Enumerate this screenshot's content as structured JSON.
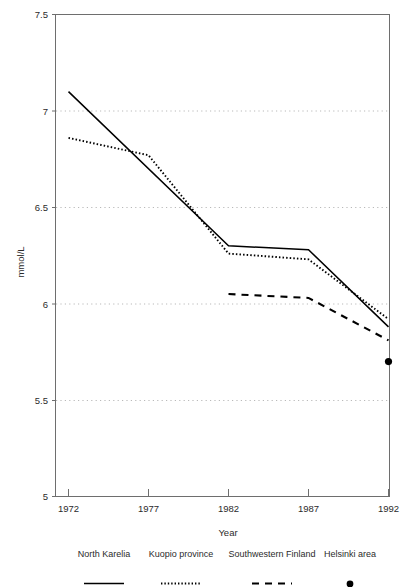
{
  "chart_data": {
    "type": "line",
    "title": "",
    "xlabel": "Year",
    "ylabel": "mmol/L",
    "x": [
      1972,
      1977,
      1982,
      1987,
      1992
    ],
    "xtick_labels": [
      "1972",
      "1977",
      "1982",
      "1987",
      "1992"
    ],
    "xlim": [
      1972,
      1992
    ],
    "ytick_labels": [
      "5",
      "5.5",
      "6",
      "6.5",
      "7",
      "7.5"
    ],
    "yticks": [
      5,
      5.5,
      6,
      6.5,
      7,
      7.5
    ],
    "ylim": [
      5,
      7.5
    ],
    "grid": "horizontal-dotted",
    "legend_position": "bottom",
    "series": [
      {
        "name": "North Karelia",
        "style": "solid",
        "color": "#000000",
        "x": [
          1972,
          1982,
          1987,
          1992
        ],
        "values": [
          7.1,
          6.3,
          6.28,
          5.88
        ]
      },
      {
        "name": "Kuopio province",
        "style": "dotted",
        "color": "#000000",
        "x": [
          1972,
          1977,
          1982,
          1987,
          1992
        ],
        "values": [
          6.86,
          6.77,
          6.26,
          6.23,
          5.92
        ]
      },
      {
        "name": "Southwestern Finland",
        "style": "dashed",
        "color": "#000000",
        "x": [
          1982,
          1987,
          1992
        ],
        "values": [
          6.05,
          6.03,
          5.81
        ]
      },
      {
        "name": "Helsinki area",
        "style": "marker-dot",
        "color": "#000000",
        "x": [
          1992
        ],
        "values": [
          5.7
        ]
      }
    ]
  },
  "axes": {
    "ylabel": "mmol/L",
    "xlabel": "Year",
    "ytick_labels": [
      "7.5",
      "7",
      "6.5",
      "6",
      "5.5",
      "5"
    ],
    "xtick_labels": [
      "1972",
      "1977",
      "1982",
      "1987",
      "1992"
    ]
  },
  "legend": {
    "items": [
      {
        "label": "North Karelia",
        "symbol": "solid-line"
      },
      {
        "label": "Kuopio province",
        "symbol": "dotted-line"
      },
      {
        "label": "Southwestern Finland",
        "symbol": "dashed-line"
      },
      {
        "label": "Helsinki area",
        "symbol": "filled-circle"
      }
    ]
  },
  "colors": {
    "line": "#000000",
    "axis": "#6e6e6e",
    "grid": "#c9c9c9",
    "text": "#2b2b2b",
    "background": "#ffffff"
  }
}
